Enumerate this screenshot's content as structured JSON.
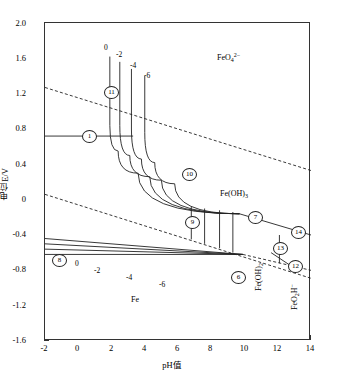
{
  "chart_data": {
    "type": "line",
    "title": "",
    "xlabel": "pH值",
    "ylabel": "电位E/V",
    "xlim": [
      -2,
      14
    ],
    "ylim": [
      -1.6,
      2.0
    ],
    "grid": false,
    "legend": "none",
    "xticks": [
      "-2",
      "0",
      "2",
      "4",
      "6",
      "8",
      "10",
      "12",
      "14"
    ],
    "xtick_values": [
      -2,
      0,
      2,
      4,
      6,
      8,
      10,
      12,
      14
    ],
    "yticks": [
      "2.0",
      "1.6",
      "1.2",
      "0.8",
      "0.4",
      "0",
      "-0.4",
      "-0.8",
      "-1.2",
      "-1.6"
    ],
    "ytick_values": [
      2.0,
      1.6,
      1.2,
      0.8,
      0.4,
      0,
      -0.4,
      -0.8,
      -1.2,
      -1.6
    ],
    "series": [
      {
        "name": "water-stability-upper",
        "style": "dashed",
        "points": [
          [
            -2,
            1.27
          ],
          [
            14,
            0.33
          ]
        ]
      },
      {
        "name": "water-stability-lower",
        "style": "dashed",
        "points": [
          [
            -2,
            0.06
          ],
          [
            14,
            -0.89
          ]
        ]
      },
      {
        "name": "line-1-horizontal",
        "style": "solid",
        "points": [
          [
            -2,
            0.72
          ],
          [
            3.3,
            0.72
          ]
        ]
      },
      {
        "name": "line-11-vertical-c0",
        "style": "solid",
        "points": [
          [
            1.9,
            1.62
          ],
          [
            1.9,
            0.84
          ]
        ]
      },
      {
        "name": "boundary-c0",
        "style": "solid",
        "points": [
          [
            1.9,
            0.84
          ],
          [
            2.4,
            0.55
          ],
          [
            3.6,
            0.3
          ],
          [
            9.7,
            -0.16
          ]
        ]
      },
      {
        "name": "line-vertical-c-2",
        "style": "solid",
        "points": [
          [
            2.5,
            1.56
          ],
          [
            2.5,
            0.84
          ]
        ]
      },
      {
        "name": "boundary-c-2",
        "style": "solid",
        "points": [
          [
            2.5,
            0.84
          ],
          [
            3.1,
            0.5
          ],
          [
            4.3,
            0.26
          ],
          [
            9.7,
            -0.16
          ]
        ]
      },
      {
        "name": "line-vertical-c-4",
        "style": "solid",
        "points": [
          [
            3.2,
            1.48
          ],
          [
            3.2,
            0.8
          ]
        ]
      },
      {
        "name": "boundary-c-4",
        "style": "solid",
        "points": [
          [
            3.2,
            0.8
          ],
          [
            3.8,
            0.46
          ],
          [
            5.0,
            0.22
          ],
          [
            9.7,
            -0.16
          ]
        ]
      },
      {
        "name": "line-vertical-c-6",
        "style": "solid",
        "points": [
          [
            4.0,
            1.4
          ],
          [
            4.0,
            0.76
          ]
        ]
      },
      {
        "name": "boundary-c-6",
        "style": "solid",
        "points": [
          [
            4.0,
            0.76
          ],
          [
            4.6,
            0.42
          ],
          [
            5.8,
            0.18
          ],
          [
            9.7,
            -0.16
          ]
        ]
      },
      {
        "name": "line-7-to-14",
        "style": "solid",
        "points": [
          [
            9.7,
            -0.16
          ],
          [
            14,
            -0.4
          ]
        ]
      },
      {
        "name": "line-8-horizontal-c0",
        "style": "solid",
        "points": [
          [
            -2,
            -0.44
          ],
          [
            9.9,
            -0.62
          ]
        ]
      },
      {
        "name": "line-horizontal-c-2",
        "style": "solid",
        "points": [
          [
            -2,
            -0.5
          ],
          [
            9.9,
            -0.62
          ]
        ]
      },
      {
        "name": "line-horizontal-c-4",
        "style": "solid",
        "points": [
          [
            -2,
            -0.56
          ],
          [
            9.9,
            -0.62
          ]
        ]
      },
      {
        "name": "line-horizontal-c-6",
        "style": "solid",
        "points": [
          [
            -2,
            -0.62
          ],
          [
            9.9,
            -0.62
          ]
        ]
      },
      {
        "name": "line-6-to-12",
        "style": "dashed",
        "points": [
          [
            9.9,
            -0.62
          ],
          [
            14,
            -0.8
          ]
        ]
      },
      {
        "name": "line-13-vertical",
        "style": "solid",
        "points": [
          [
            12.1,
            -0.4
          ],
          [
            12.1,
            -0.72
          ]
        ]
      },
      {
        "name": "line-12-short",
        "style": "solid",
        "points": [
          [
            11.6,
            -0.6
          ],
          [
            13.2,
            -0.8
          ]
        ]
      },
      {
        "name": "drop-9-a",
        "style": "solid",
        "points": [
          [
            6.8,
            -0.08
          ],
          [
            6.8,
            -0.45
          ]
        ]
      },
      {
        "name": "drop-9-b",
        "style": "solid",
        "points": [
          [
            7.6,
            -0.1
          ],
          [
            7.6,
            -0.5
          ]
        ]
      },
      {
        "name": "drop-9-c",
        "style": "solid",
        "points": [
          [
            8.5,
            -0.12
          ],
          [
            8.5,
            -0.55
          ]
        ]
      },
      {
        "name": "drop-9-d",
        "style": "solid",
        "points": [
          [
            9.3,
            -0.14
          ],
          [
            9.3,
            -0.6
          ]
        ]
      }
    ],
    "region_labels": [
      {
        "text": "FeO4 2-",
        "x": 11.2,
        "y": 1.58
      },
      {
        "text": "Fe(OH)3",
        "x": 11.4,
        "y": -0.02
      },
      {
        "text": "Fe",
        "x": 3.2,
        "y": -1.18
      },
      {
        "text": "Fe(OH)2",
        "x": 11.8,
        "y": -0.95
      },
      {
        "text": "FeO2H-",
        "x": 13.4,
        "y": -1.12
      }
    ],
    "annotations": [
      {
        "type": "circled-number",
        "label": "1",
        "x": 0.6,
        "y": 0.72
      },
      {
        "type": "circled-number",
        "label": "11",
        "x": 1.9,
        "y": 1.22
      },
      {
        "type": "circled-number",
        "label": "10",
        "x": 6.6,
        "y": 0.29
      },
      {
        "type": "circled-number",
        "label": "9",
        "x": 6.8,
        "y": -0.26
      },
      {
        "type": "circled-number",
        "label": "7",
        "x": 10.6,
        "y": -0.2
      },
      {
        "type": "circled-number",
        "label": "14",
        "x": 13.2,
        "y": -0.37
      },
      {
        "type": "circled-number",
        "label": "13",
        "x": 12.1,
        "y": -0.55
      },
      {
        "type": "circled-number",
        "label": "12",
        "x": 13.0,
        "y": -0.76
      },
      {
        "type": "circled-number",
        "label": "8",
        "x": -1.4,
        "y": -0.45
      },
      {
        "type": "circled-number",
        "label": "6",
        "x": 9.9,
        "y": -0.63
      },
      {
        "type": "conc-label",
        "label": "0",
        "x": 1.75,
        "y": 1.7
      },
      {
        "type": "conc-label",
        "label": "-2",
        "x": 2.6,
        "y": 1.62
      },
      {
        "type": "conc-label",
        "label": "-4",
        "x": 3.4,
        "y": 1.5
      },
      {
        "type": "conc-label",
        "label": "-6",
        "x": 4.25,
        "y": 1.38
      },
      {
        "type": "conc-label",
        "label": "0",
        "x": -0.05,
        "y": -0.44
      },
      {
        "type": "conc-label",
        "label": "-2",
        "x": 1.15,
        "y": -0.5
      },
      {
        "type": "conc-label",
        "label": "-4",
        "x": 3.05,
        "y": -0.57
      },
      {
        "type": "conc-label",
        "label": "-6",
        "x": 5.05,
        "y": -0.64
      }
    ]
  },
  "axes": {
    "x_title": "pH值",
    "y_title": "电位E/V",
    "x_tick_labels": [
      "-2",
      "0",
      "2",
      "4",
      "6",
      "8",
      "10",
      "12",
      "14"
    ],
    "y_tick_labels": [
      "2.0",
      "1.6",
      "1.2",
      "0.8",
      "0.4",
      "0",
      "-0.4",
      "-0.8",
      "-1.2",
      "-1.6"
    ]
  },
  "species": {
    "ferrate": {
      "formula": "FeO",
      "sub": "4",
      "sup": "2−"
    },
    "ferric_hyd": {
      "formula": "Fe(OH)",
      "sub": "3",
      "sup": ""
    },
    "iron_metal": {
      "formula": "Fe",
      "sub": "",
      "sup": ""
    },
    "ferrous_hyd": {
      "formula": "Fe(OH)",
      "sub": "2",
      "sup": ""
    },
    "hypoferrite": {
      "formula": "FeO",
      "sub": "2",
      "sup": "",
      "tail": "H⁻"
    }
  },
  "circled": {
    "n1": "1",
    "n6": "6",
    "n7": "7",
    "n8": "8",
    "n9": "9",
    "n10": "10",
    "n11": "11",
    "n12": "12",
    "n13": "13",
    "n14": "14"
  },
  "concentration_labels": {
    "top": [
      "0",
      "-2",
      "-4",
      "-6"
    ],
    "bottom": [
      "0",
      "-2",
      "-4",
      "-6"
    ]
  },
  "colors": {
    "line": "#222222",
    "frame": "#333333",
    "background": "#ffffff"
  }
}
